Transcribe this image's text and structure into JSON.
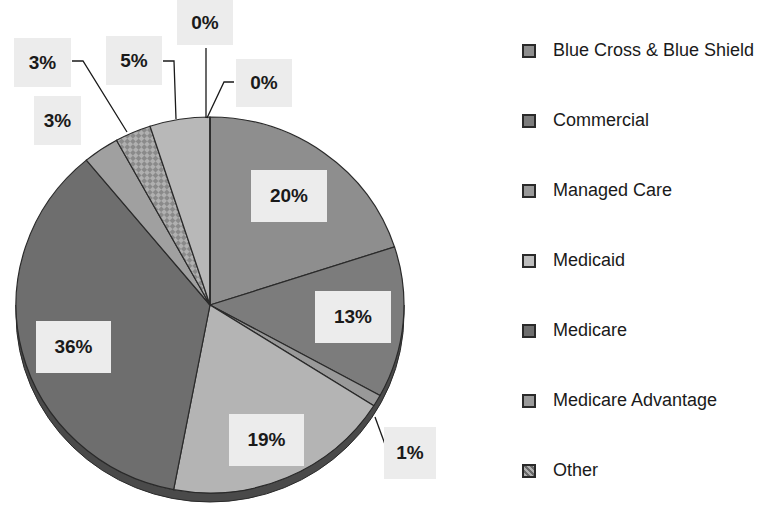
{
  "chart_data": {
    "type": "pie",
    "title": "",
    "style": "3d-tilted pie, grayscale",
    "slices": [
      {
        "label": "Blue Cross & Blue Shield",
        "value": 20,
        "display": "20%",
        "color": "#8e8e8e"
      },
      {
        "label": "Commercial",
        "value": 13,
        "display": "13%",
        "color": "#7c7c7c"
      },
      {
        "label": "Managed Care",
        "value": 1,
        "display": "1%",
        "color": "#999999"
      },
      {
        "label": "Medicaid",
        "value": 19,
        "display": "19%",
        "color": "#b4b4b4"
      },
      {
        "label": "Medicare",
        "value": 36,
        "display": "36%",
        "color": "#6e6e6e"
      },
      {
        "label": "Medicare Advantage",
        "value": 3,
        "display": "3%",
        "color": "#a0a0a0"
      },
      {
        "label": "Other",
        "value": 3,
        "display": "3%",
        "color": "#8a8a8a",
        "pattern": "checkered"
      },
      {
        "label": "",
        "value": 5,
        "display": "5%",
        "color": "#b8b8b8"
      },
      {
        "label": "",
        "value": 0,
        "display": "0%",
        "color": "#a8a8a8"
      },
      {
        "label": "",
        "value": 0,
        "display": "0%",
        "color": "#a8a8a8"
      }
    ],
    "legend": {
      "position": "right",
      "entries": [
        {
          "label": "Blue Cross & Blue Shield",
          "color": "#8e8e8e"
        },
        {
          "label": "Commercial",
          "color": "#7c7c7c"
        },
        {
          "label": "Managed Care",
          "color": "#999999"
        },
        {
          "label": "Medicaid",
          "color": "#bdbdbd"
        },
        {
          "label": "Medicare",
          "color": "#6e6e6e"
        },
        {
          "label": "Medicare Advantage",
          "color": "#9a9a9a"
        },
        {
          "label": "Other",
          "color": "#8a8a8a",
          "pattern": "checkered"
        }
      ]
    }
  },
  "labels": {
    "bcbs": "20%",
    "commercial": "13%",
    "managed_care": "1%",
    "medicaid": "19%",
    "medicare": "36%",
    "medicare_advantage": "3%",
    "other": "3%",
    "five": "5%",
    "zero_a": "0%",
    "zero_b": "0%"
  }
}
